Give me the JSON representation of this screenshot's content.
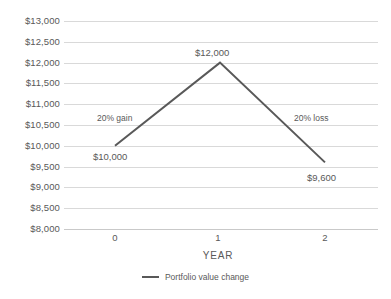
{
  "chart_data": {
    "type": "line",
    "title": "",
    "xlabel": "YEAR",
    "ylabel": "",
    "x": [
      0,
      1,
      2
    ],
    "categories": [
      "0",
      "1",
      "2"
    ],
    "series": [
      {
        "name": "Portfolio value change",
        "values": [
          10000,
          12000,
          9600
        ],
        "color": "#595959"
      }
    ],
    "ylim": [
      8000,
      13000
    ],
    "yticks": [
      8000,
      8500,
      9000,
      9500,
      10000,
      10500,
      11000,
      11500,
      12000,
      12500,
      13000
    ],
    "ytick_labels": [
      "$8,000",
      "$8,500",
      "$9,000",
      "$9,500",
      "$10,000",
      "$10,500",
      "$11,000",
      "$11,500",
      "$12,000",
      "$12,500",
      "$13,000"
    ],
    "xtick_labels": [
      "0",
      "1",
      "2"
    ],
    "grid": true,
    "legend_position": "bottom",
    "point_labels": [
      {
        "text": "$10,000",
        "x": 0,
        "y": 10000
      },
      {
        "text": "$12,000",
        "x": 1,
        "y": 12000
      },
      {
        "text": "$9,600",
        "x": 2,
        "y": 9600
      }
    ],
    "annotations": [
      {
        "text": "20% gain",
        "segment": "0-1"
      },
      {
        "text": "20% loss",
        "segment": "1-2"
      }
    ],
    "colors": {
      "series_line": "#595959",
      "gridline": "#d9d9d9",
      "text": "#595959",
      "background": "#ffffff"
    }
  },
  "legend": {
    "items": [
      {
        "label": "Portfolio value change"
      }
    ]
  }
}
